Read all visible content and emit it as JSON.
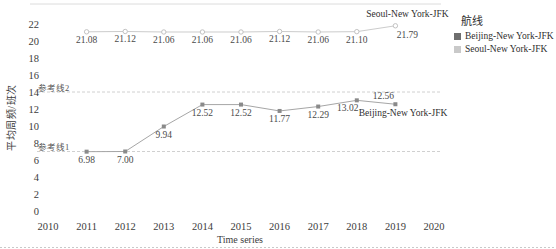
{
  "chart_data": {
    "type": "line",
    "title": "",
    "xlabel": "Time series",
    "ylabel": "平均周频/班次",
    "xlim": [
      2010,
      2020
    ],
    "ylim": [
      0,
      22
    ],
    "grid": false,
    "x_ticks": [
      2010,
      2011,
      2012,
      2013,
      2014,
      2015,
      2016,
      2017,
      2018,
      2019,
      2020
    ],
    "y_ticks": [
      0,
      2,
      4,
      6,
      8,
      10,
      12,
      14,
      16,
      18,
      20,
      22
    ],
    "x": [
      2011,
      2012,
      2013,
      2014,
      2015,
      2016,
      2017,
      2018,
      2019
    ],
    "reference_lines": [
      {
        "label": "参考线1",
        "value": 7
      },
      {
        "label": "参考线2",
        "value": 14
      }
    ],
    "series": [
      {
        "name": "Beijing-New York-JFK",
        "line_color": "#a6a6a6",
        "marker": "filled-square",
        "marker_color": "#8a8a8a",
        "values": [
          6.98,
          7.0,
          9.94,
          12.52,
          12.52,
          11.77,
          12.29,
          13.02,
          12.56
        ],
        "labels": [
          "6.98",
          "7.00",
          "9.94",
          "12.52",
          "12.52",
          "11.77",
          "12.29",
          "13.02",
          "12.56"
        ],
        "label_positions": [
          "below",
          "below",
          "below",
          "below",
          "below",
          "below",
          "below",
          "below-left",
          "above"
        ],
        "end_label": {
          "text": "Beijing-New York-JFK",
          "position": "below-right-end"
        }
      },
      {
        "name": "Seoul-New York-JFK",
        "line_color": "#cccccc",
        "marker": "open-circle",
        "marker_color": "#c2c2c2",
        "values": [
          21.08,
          21.12,
          21.06,
          21.06,
          21.06,
          21.12,
          21.06,
          21.1,
          21.79
        ],
        "labels": [
          "21.08",
          "21.12",
          "21.06",
          "21.06",
          "21.06",
          "21.12",
          "21.06",
          "21.10",
          "21.79"
        ],
        "label_positions": [
          "below",
          "below",
          "below",
          "below",
          "below",
          "below",
          "below",
          "below",
          "below-right"
        ],
        "end_label": {
          "text": "Seoul-New York-JFK",
          "position": "above-end"
        }
      }
    ],
    "legend": {
      "title": "航线",
      "position": "right",
      "items": [
        {
          "label": "Beijing-New York-JFK",
          "color": "#6e6e6e"
        },
        {
          "label": "Seoul-New York-JFK",
          "color": "#c9c9c9"
        }
      ]
    },
    "colors": {
      "text": "#3c3c3c",
      "data_label": "#4a4a4a",
      "reference_line": "#d0d0d0",
      "plot_border": "#dcdcdc",
      "bottom_rule": "#c9c9c9"
    }
  }
}
